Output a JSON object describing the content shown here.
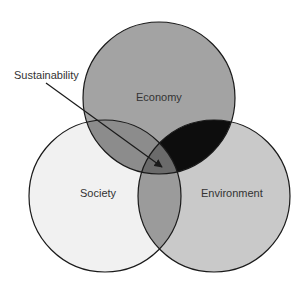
{
  "diagram": {
    "type": "venn",
    "circles": [
      {
        "id": "economy",
        "label": "Economy",
        "cx": 159,
        "cy": 98,
        "r": 76
      },
      {
        "id": "society",
        "label": "Society",
        "cx": 105,
        "cy": 196,
        "r": 76
      },
      {
        "id": "environment",
        "label": "Environment",
        "cx": 214,
        "cy": 196,
        "r": 76
      }
    ],
    "callout": {
      "label": "Sustainability",
      "points_to": "economy ∩ society ∩ environment"
    },
    "colors": {
      "economy_only": "#a3a3a3",
      "society_only": "#f1f1f1",
      "environment_only": "#c9c9c9",
      "economy_society": "#8c8c8c",
      "economy_environment": "#0d0d0d",
      "society_environment": "#9b9b9b",
      "all_three": "#6b6b6b",
      "stroke": "#1a1a1a"
    }
  }
}
